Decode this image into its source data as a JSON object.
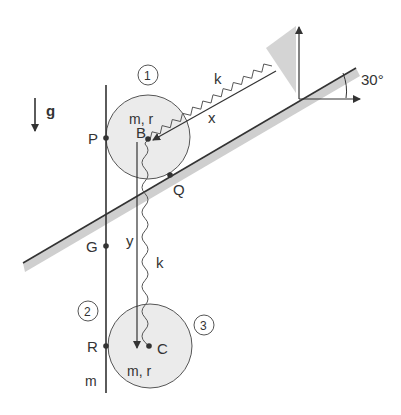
{
  "labels": {
    "gravity": "g",
    "body1_number": "1",
    "body2_number": "2",
    "body3_number": "3",
    "body1_props": "m, r",
    "body3_props": "m, r",
    "rod_mass": "m",
    "point_P": "P",
    "point_B": "B",
    "point_Q": "Q",
    "point_G": "G",
    "point_R": "R",
    "point_C": "C",
    "spring_upper": "k",
    "spring_lower": "k",
    "coord_x": "x",
    "coord_y": "y",
    "angle": "30°"
  },
  "colors": {
    "line": "#333333",
    "disk_fill": "#ebebeb",
    "shade": "#cccccc",
    "background": "#ffffff"
  }
}
